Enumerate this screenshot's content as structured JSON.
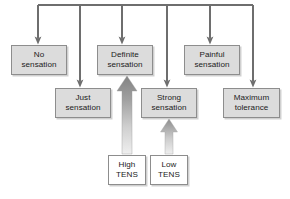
{
  "figure": {
    "caption_text": "",
    "colors": {
      "box_fill_sensation": "#dcdcdc",
      "box_fill_source": "#ffffff",
      "box_border": "#8d8d8d",
      "connector_line": "#6e6e6e",
      "grey_arrow_dark": "#8a8a8a",
      "grey_arrow_light": "#e8e8e8",
      "text": "#1b1b1b",
      "background": "#ffffff"
    }
  },
  "bus": {
    "label": "horizontal-distribution-bus",
    "y": 5,
    "x_start": 38,
    "x_end": 253,
    "drop_x": [
      38,
      80,
      122,
      167,
      210,
      253
    ]
  },
  "nodes": [
    {
      "id": "no-sensation",
      "kind": "sensation",
      "lines": [
        "No",
        "sensation"
      ],
      "x": 11,
      "y": 45,
      "w": 56,
      "h": 30
    },
    {
      "id": "just-sensation",
      "kind": "sensation",
      "lines": [
        "Just",
        "sensation"
      ],
      "x": 55,
      "y": 88,
      "w": 56,
      "h": 30
    },
    {
      "id": "definite-sensation",
      "kind": "sensation",
      "lines": [
        "Definite",
        "sensation"
      ],
      "x": 97,
      "y": 45,
      "w": 56,
      "h": 30
    },
    {
      "id": "strong-sensation",
      "kind": "sensation",
      "lines": [
        "Strong",
        "sensation"
      ],
      "x": 141,
      "y": 88,
      "w": 56,
      "h": 30
    },
    {
      "id": "painful-sensation",
      "kind": "sensation",
      "lines": [
        "Painful",
        "sensation"
      ],
      "x": 184,
      "y": 45,
      "w": 56,
      "h": 30
    },
    {
      "id": "maximum-tolerance",
      "kind": "sensation",
      "lines": [
        "Maximum",
        "tolerance"
      ],
      "x": 223,
      "y": 88,
      "w": 57,
      "h": 30
    },
    {
      "id": "high-tens",
      "kind": "source",
      "lines": [
        "High",
        "TENS"
      ],
      "x": 108,
      "y": 155,
      "w": 38,
      "h": 30
    },
    {
      "id": "low-tens",
      "kind": "source",
      "lines": [
        "Low",
        "TENS"
      ],
      "x": 150,
      "y": 155,
      "w": 38,
      "h": 30
    }
  ],
  "connectors": [
    {
      "id": "bus-to-no-sensation",
      "from": "bus",
      "to": "no-sensation",
      "x": 38,
      "y_from": 5,
      "y_to": 44
    },
    {
      "id": "bus-to-just-sensation",
      "from": "bus",
      "to": "just-sensation",
      "x": 80,
      "y_from": 5,
      "y_to": 87
    },
    {
      "id": "bus-to-definite-sensation",
      "from": "bus",
      "to": "definite-sensation",
      "x": 122,
      "y_from": 5,
      "y_to": 44
    },
    {
      "id": "bus-to-strong-sensation",
      "from": "bus",
      "to": "strong-sensation",
      "x": 167,
      "y_from": 5,
      "y_to": 87
    },
    {
      "id": "bus-to-painful-sensation",
      "from": "bus",
      "to": "painful-sensation",
      "x": 210,
      "y_from": 5,
      "y_to": 44
    },
    {
      "id": "bus-to-maximum-tolerance",
      "from": "bus",
      "to": "maximum-tolerance",
      "x": 253,
      "y_from": 5,
      "y_to": 87
    }
  ],
  "grey_arrows": [
    {
      "id": "high-tens-arrow",
      "label": "high-tens-to-definite-sensation-arrow",
      "from": "high-tens",
      "to": "definite-sensation",
      "x_center": 127,
      "y_tail": 154,
      "y_tip": 76,
      "shaft_width": 10,
      "head_width": 20,
      "head_height": 15
    },
    {
      "id": "low-tens-arrow",
      "label": "low-tens-to-strong-sensation-arrow",
      "from": "low-tens",
      "to": "strong-sensation",
      "x_center": 169,
      "y_tail": 154,
      "y_tip": 119,
      "shaft_width": 8,
      "head_width": 17,
      "head_height": 13
    }
  ]
}
